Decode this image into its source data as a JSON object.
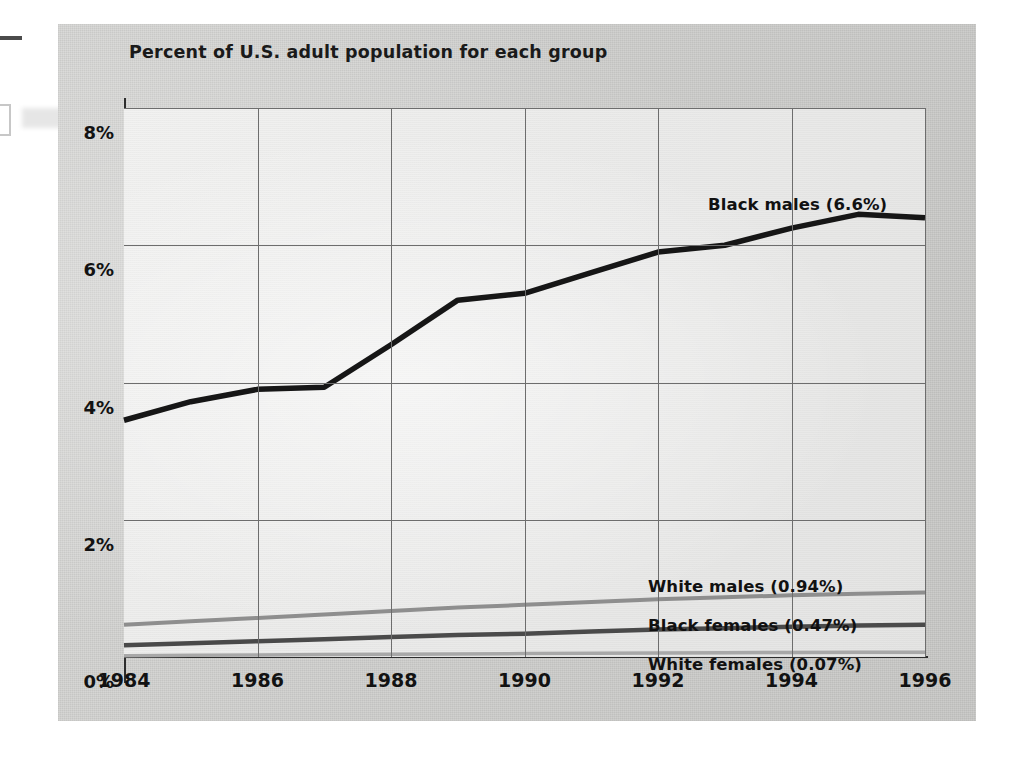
{
  "figure": {
    "title": "Percent of U.S. adult population for each group"
  },
  "axes": {
    "y_ticks": [
      "0%",
      "2%",
      "4%",
      "6%",
      "8%"
    ],
    "x_ticks": [
      "1984",
      "1986",
      "1988",
      "1990",
      "1992",
      "1994",
      "1996"
    ]
  },
  "labels": {
    "black_males": "Black males (6.6%)",
    "white_males": "White males (0.94%)",
    "black_females": "Black females (0.47%)",
    "white_females": "White females (0.07%)"
  },
  "colors": {
    "black_males": "#161616",
    "white_males": "#8e8e8e",
    "black_females": "#4a4a4a",
    "white_females": "#a8a8a8",
    "grid": "#6d6d6d",
    "axis": "#2d2d2d",
    "panel": "#d2d2d0",
    "plot": "#ececeb",
    "text": "#111111"
  },
  "chart_data": {
    "type": "line",
    "title": "Percent of U.S. adult population for each group",
    "xlabel": "",
    "ylabel": "Percent of U.S. adult population",
    "xlim": [
      1984,
      1996
    ],
    "ylim": [
      0,
      8
    ],
    "grid": true,
    "legend": "inline-labels",
    "x": [
      1984,
      1985,
      1986,
      1987,
      1988,
      1989,
      1990,
      1991,
      1992,
      1993,
      1994,
      1995,
      1996
    ],
    "series": [
      {
        "name": "Black males",
        "end_value_label": "6.6%",
        "color": "#161616",
        "values": [
          3.45,
          3.72,
          3.9,
          3.93,
          4.55,
          5.2,
          5.3,
          5.6,
          5.9,
          6.0,
          6.25,
          6.45,
          6.4
        ]
      },
      {
        "name": "White males",
        "end_value_label": "0.94%",
        "color": "#8e8e8e",
        "values": [
          0.47,
          0.52,
          0.57,
          0.62,
          0.67,
          0.72,
          0.76,
          0.8,
          0.84,
          0.87,
          0.9,
          0.92,
          0.94
        ]
      },
      {
        "name": "Black females",
        "end_value_label": "0.47%",
        "color": "#4a4a4a",
        "values": [
          0.17,
          0.2,
          0.23,
          0.26,
          0.29,
          0.32,
          0.34,
          0.37,
          0.4,
          0.42,
          0.44,
          0.46,
          0.47
        ]
      },
      {
        "name": "White females",
        "end_value_label": "0.07%",
        "color": "#a8a8a8",
        "values": [
          0.02,
          0.025,
          0.03,
          0.035,
          0.04,
          0.045,
          0.05,
          0.055,
          0.06,
          0.063,
          0.066,
          0.068,
          0.07
        ]
      }
    ]
  }
}
